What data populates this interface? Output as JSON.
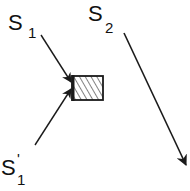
{
  "labels": {
    "s1_main": "S",
    "s1_sub": "1",
    "s2_main": "S",
    "s2_sub": "2",
    "s1p_main": "S",
    "s1p_prime": "'",
    "s1p_sub": "1"
  },
  "colors": {
    "stroke": "#1a1a1a",
    "background": "#ffffff"
  }
}
